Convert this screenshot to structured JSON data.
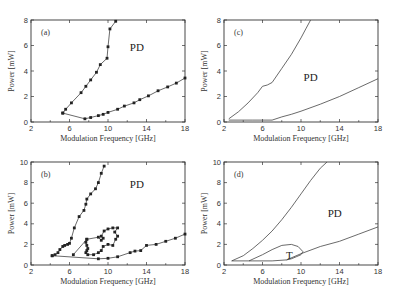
{
  "figure": {
    "panels": [
      {
        "id": "a",
        "label": "(a)",
        "region_labels": [
          {
            "text": "PD",
            "x": 13,
            "y": 5.6
          }
        ]
      },
      {
        "id": "c",
        "label": "(c)",
        "region_labels": [
          {
            "text": "PD",
            "x": 11,
            "y": 3.2
          }
        ]
      },
      {
        "id": "b",
        "label": "(b)",
        "region_labels": [
          {
            "text": "PD",
            "x": 13,
            "y": 7.5
          }
        ]
      },
      {
        "id": "d",
        "label": "(d)",
        "region_labels": [
          {
            "text": "PD",
            "x": 13.5,
            "y": 4.7
          },
          {
            "text": "T",
            "x": 8.8,
            "y": 0.6
          }
        ]
      }
    ]
  },
  "chart_data": [
    {
      "panel": "a",
      "type": "line",
      "title": "(a)",
      "xlabel": "Modulation Frequency [GHz]",
      "ylabel": "Power [mW]",
      "xlim": [
        2,
        18
      ],
      "ylim": [
        0,
        8
      ],
      "xticks": [
        2,
        6,
        10,
        14,
        18
      ],
      "yticks": [
        0,
        2,
        4,
        6,
        8
      ],
      "grid": false,
      "annotations": [
        "PD"
      ],
      "markers": true,
      "series": [
        {
          "name": "upper boundary",
          "x": [
            5.3,
            5.6,
            6.2,
            7.2,
            7.7,
            8.2,
            8.8,
            9.2,
            9.9,
            10.0,
            10.2,
            10.8
          ],
          "y": [
            0.7,
            1.0,
            1.5,
            2.3,
            2.8,
            3.3,
            3.9,
            4.5,
            5.0,
            5.9,
            7.3,
            7.9
          ]
        },
        {
          "name": "lower boundary",
          "x": [
            5.3,
            7.6,
            8.2,
            9.0,
            9.5,
            10.0,
            11.0,
            11.7,
            12.7,
            13.3,
            14.2,
            15.2,
            16.2,
            17.1,
            18.0
          ],
          "y": [
            0.7,
            0.25,
            0.35,
            0.5,
            0.6,
            0.75,
            1.0,
            1.25,
            1.5,
            1.75,
            2.05,
            2.45,
            2.75,
            3.05,
            3.45
          ]
        }
      ]
    },
    {
      "panel": "c",
      "type": "line",
      "title": "(c)",
      "xlabel": "Modulation Frequency [GHz]",
      "ylabel": "Power [mW]",
      "xlim": [
        2,
        18
      ],
      "ylim": [
        0,
        8
      ],
      "xticks": [
        2,
        6,
        10,
        14,
        18
      ],
      "yticks": [
        0,
        2,
        4,
        6,
        8
      ],
      "grid": false,
      "annotations": [
        "PD"
      ],
      "markers": false,
      "series": [
        {
          "name": "upper boundary",
          "x": [
            2.5,
            3.5,
            4.5,
            5.5,
            6.0,
            6.5,
            7.0,
            8.0,
            9.0,
            10.0,
            10.5,
            11.0
          ],
          "y": [
            0.25,
            0.8,
            1.5,
            2.3,
            2.8,
            2.9,
            3.1,
            4.2,
            5.3,
            6.6,
            7.3,
            8.0
          ]
        },
        {
          "name": "lower boundary",
          "x": [
            2.5,
            5.0,
            7.0,
            8.0,
            9.0,
            10.0,
            12.0,
            14.0,
            16.0,
            18.0
          ],
          "y": [
            0.15,
            0.15,
            0.15,
            0.4,
            0.6,
            0.85,
            1.4,
            2.0,
            2.7,
            3.4
          ]
        }
      ]
    },
    {
      "panel": "b",
      "type": "line",
      "title": "(b)",
      "xlabel": "Modulation Frequency [GHz]",
      "ylabel": "Power [mW]",
      "xlim": [
        2,
        18
      ],
      "ylim": [
        0,
        10
      ],
      "xticks": [
        2,
        6,
        10,
        14,
        18
      ],
      "yticks": [
        0,
        2,
        4,
        6,
        8,
        10
      ],
      "grid": false,
      "annotations": [
        "PD"
      ],
      "markers": true,
      "series": [
        {
          "name": "upper boundary",
          "x": [
            4.2,
            4.5,
            4.8,
            5.0,
            5.3,
            5.5,
            5.8,
            6.0,
            6.2,
            6.5,
            7.0,
            7.5,
            7.7,
            7.8,
            8.2,
            8.7,
            9.0,
            9.3,
            9.6
          ],
          "y": [
            0.9,
            1.0,
            1.2,
            1.5,
            1.8,
            1.9,
            2.0,
            2.1,
            2.6,
            3.6,
            4.7,
            5.3,
            5.9,
            6.4,
            6.9,
            7.4,
            8.0,
            8.9,
            9.6
          ]
        },
        {
          "name": "lower boundary",
          "x": [
            4.2,
            9.0,
            10.0,
            11.0,
            12.3,
            12.8,
            13.4,
            14.0,
            15.0,
            16.0,
            17.0,
            18.0
          ],
          "y": [
            0.9,
            0.6,
            0.65,
            0.8,
            1.2,
            1.35,
            1.4,
            1.9,
            2.0,
            2.3,
            2.6,
            3.0
          ]
        },
        {
          "name": "inner loop",
          "x": [
            6.4,
            7.8,
            7.7,
            7.8,
            7.9,
            7.8,
            7.7,
            7.9,
            8.5,
            9.0,
            9.3,
            9.5,
            10.0,
            10.5,
            10.8,
            11.0,
            10.7,
            11.0,
            10.5,
            10.0,
            9.6,
            9.3,
            9.5,
            9.3,
            9.0,
            7.8
          ],
          "y": [
            1.0,
            2.5,
            2.2,
            1.9,
            1.6,
            1.4,
            1.2,
            1.0,
            1.0,
            1.2,
            1.4,
            1.8,
            2.0,
            1.9,
            2.5,
            2.8,
            3.2,
            3.6,
            3.6,
            3.5,
            3.3,
            2.8,
            2.6,
            2.4,
            2.7,
            2.5
          ]
        }
      ]
    },
    {
      "panel": "d",
      "type": "line",
      "title": "(d)",
      "xlabel": "Modulation Frequency [GHz]",
      "ylabel": "Power [mW]",
      "xlim": [
        2,
        18
      ],
      "ylim": [
        0,
        10
      ],
      "xticks": [
        2,
        6,
        10,
        14,
        18
      ],
      "yticks": [
        0,
        2,
        4,
        6,
        8,
        10
      ],
      "grid": false,
      "annotations": [
        "PD",
        "T"
      ],
      "markers": false,
      "series": [
        {
          "name": "upper boundary",
          "x": [
            2.8,
            4.0,
            5.0,
            6.0,
            7.0,
            8.0,
            9.0,
            10.0,
            11.0,
            12.0,
            12.7
          ],
          "y": [
            0.4,
            0.9,
            1.6,
            2.4,
            3.3,
            4.4,
            5.6,
            6.9,
            8.2,
            9.4,
            10.0
          ]
        },
        {
          "name": "lower boundary",
          "x": [
            2.8,
            5.0,
            7.0,
            8.5,
            10.0,
            12.0,
            14.0,
            16.0,
            18.0
          ],
          "y": [
            0.4,
            0.4,
            0.4,
            0.5,
            1.1,
            1.8,
            2.3,
            3.0,
            3.7
          ]
        },
        {
          "name": "T region boundary",
          "x": [
            4.6,
            6.0,
            7.0,
            8.0,
            9.0,
            9.7,
            10.2,
            10.0,
            9.5,
            9.0,
            8.5
          ],
          "y": [
            0.4,
            1.0,
            1.5,
            1.9,
            2.0,
            1.8,
            1.3,
            1.0,
            0.8,
            0.6,
            0.5
          ]
        }
      ]
    }
  ]
}
